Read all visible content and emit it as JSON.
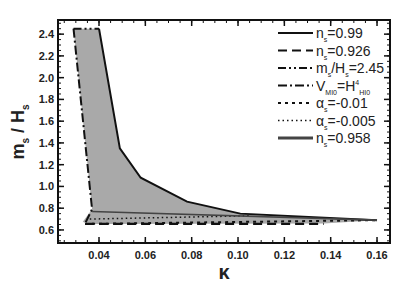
{
  "chart_data": {
    "type": "area",
    "title": "",
    "xlabel": "κ",
    "ylabel": "m_s / H_s",
    "xlim": [
      0.0223,
      0.1656
    ],
    "ylim": [
      0.48,
      2.53
    ],
    "grid": false,
    "legend_position": "upper right",
    "x_ticks": [
      0.04,
      0.06,
      0.08,
      0.1,
      0.12,
      0.14,
      0.16
    ],
    "x_tick_labels": [
      "0.04",
      "0.06",
      "0.08",
      "0.10",
      "0.12",
      "0.14",
      "0.16"
    ],
    "y_ticks": [
      0.6,
      0.8,
      1.0,
      1.2,
      1.4,
      1.6,
      1.8,
      2.0,
      2.2,
      2.4
    ],
    "y_tick_labels": [
      "0.6",
      "0.8",
      "1.0",
      "1.2",
      "1.4",
      "1.6",
      "1.8",
      "2.0",
      "2.2",
      "2.4"
    ],
    "fill_color": "#a9a9a9",
    "series": [
      {
        "name": "n_s=0.99",
        "style": "solid",
        "x": [
          0.04,
          0.049,
          0.058,
          0.078,
          0.101,
          0.16
        ],
        "y": [
          2.45,
          1.35,
          1.08,
          0.86,
          0.75,
          0.69
        ]
      },
      {
        "name": "n_s=0.926",
        "style": "dashed",
        "x": [
          0.034,
          0.137
        ],
        "y": [
          0.655,
          0.655
        ]
      },
      {
        "name": "m_s/H_s=2.45",
        "style": "dash-dot-dot",
        "x": [
          0.029,
          0.04
        ],
        "y": [
          2.45,
          2.45
        ]
      },
      {
        "name": "V_MI0=H^4_HI0",
        "style": "dash-dot",
        "x": [
          0.029,
          0.037,
          0.034
        ],
        "y": [
          2.45,
          0.79,
          0.66
        ]
      },
      {
        "name": "α_s=-0.01",
        "style": "short-dash",
        "x": [
          0.034,
          0.16
        ],
        "y": [
          0.655,
          0.69
        ]
      },
      {
        "name": "α_s=-0.005",
        "style": "dotted",
        "x": [
          0.036,
          0.105
        ],
        "y": [
          0.7,
          0.73
        ]
      },
      {
        "name": "n_s=0.958",
        "style": "solid-gray",
        "x": [
          0.037,
          0.16
        ],
        "y": [
          0.77,
          0.69
        ]
      }
    ],
    "legend_entries": [
      "n_s=0.99",
      "n_s=0.926",
      "m_s/H_s=2.45",
      "V_MI0=H^4_HI0",
      "α_s=-0.01",
      "α_s=-0.005",
      "n_s=0.958"
    ]
  },
  "axis": {
    "xlabel": "κ",
    "ylabel_main_m": "m",
    "ylabel_sub_s1": "s",
    "ylabel_slash": " / ",
    "ylabel_main_H": "H",
    "ylabel_sub_s2": "s"
  },
  "legend": [
    {
      "main": "n",
      "sub": "s",
      "rest": "=0.99",
      "sub2": "",
      "rest2": ""
    },
    {
      "main": "n",
      "sub": "s",
      "rest": "=0.926",
      "sub2": "",
      "rest2": ""
    },
    {
      "main": "m",
      "sub": "s",
      "rest": "/H",
      "sub2": "s",
      "rest2": "=2.45"
    },
    {
      "main": "V",
      "sub": "MI0",
      "rest": "=H",
      "sup": "4",
      "sub2": "HI0",
      "rest2": ""
    },
    {
      "main": "α",
      "sub": "s",
      "rest": "=-0.01",
      "sub2": "",
      "rest2": ""
    },
    {
      "main": "α",
      "sub": "s",
      "rest": "=-0.005",
      "sub2": "",
      "rest2": ""
    },
    {
      "main": "n",
      "sub": "s",
      "rest": "=0.958",
      "sub2": "",
      "rest2": ""
    }
  ]
}
